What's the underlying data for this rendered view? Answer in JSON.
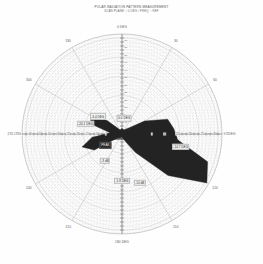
{
  "title": {
    "line1": "POLAR RADIATION PATTERN MEASUREMENT",
    "line2": "SCAN PLANE :: 0 DEG  /  FREQ :: REF"
  },
  "chart_data": {
    "type": "line",
    "subtype": "polar",
    "title": "POLAR RADIATION PATTERN MEASUREMENT",
    "subtitle": "SCAN PLANE :: 0 DEG  /  FREQ :: REF",
    "grid": true,
    "legend_position": "none",
    "angle_unit": "deg",
    "angle_direction": "counterclockwise",
    "angle_zero_at": "top",
    "rlim": [
      0,
      1
    ],
    "sector_count": 12,
    "ring_count": 26,
    "perimeter_labels": [
      {
        "angle": 0,
        "label": "0 DEG"
      },
      {
        "angle": 30,
        "label": "30"
      },
      {
        "angle": 60,
        "label": "60"
      },
      {
        "angle": 90,
        "label": "90 DEG"
      },
      {
        "angle": 120,
        "label": "120"
      },
      {
        "angle": 150,
        "label": "150"
      },
      {
        "angle": 180,
        "label": "180 DEG"
      },
      {
        "angle": 210,
        "label": "210"
      },
      {
        "angle": 240,
        "label": "240"
      },
      {
        "angle": 270,
        "label": "270 DEG"
      },
      {
        "angle": 300,
        "label": "300"
      },
      {
        "angle": 330,
        "label": "330"
      }
    ],
    "h_axis_ticks_left": [
      "-60",
      "-50",
      "-40",
      "-30",
      "-25",
      "-20",
      "-15",
      "-10",
      "-5"
    ],
    "h_axis_ticks_right": [
      "-5",
      "-10",
      "-15",
      "-20",
      "-25",
      "-30"
    ],
    "h_axis_end_left": "-70",
    "h_axis_end_right": "-70",
    "v_axis_ticks": [
      "-5",
      "-10",
      "-15",
      "-20",
      "-25",
      "-30",
      "-35",
      "-40",
      "-45",
      "-50",
      "-55",
      "-60"
    ],
    "series": [
      {
        "name": "pattern",
        "fill": "#232323",
        "points": [
          {
            "angle": 0,
            "r": 0.055
          },
          {
            "angle": 12,
            "r": 0.05
          },
          {
            "angle": 24,
            "r": 0.045
          },
          {
            "angle": 36,
            "r": 0.06
          },
          {
            "angle": 48,
            "r": 0.09
          },
          {
            "angle": 60,
            "r": 0.26
          },
          {
            "angle": 72,
            "r": 0.48
          },
          {
            "angle": 84,
            "r": 0.52
          },
          {
            "angle": 96,
            "r": 0.56
          },
          {
            "angle": 108,
            "r": 0.9
          },
          {
            "angle": 120,
            "r": 0.98
          },
          {
            "angle": 132,
            "r": 0.62
          },
          {
            "angle": 144,
            "r": 0.23
          },
          {
            "angle": 156,
            "r": 0.08
          },
          {
            "angle": 168,
            "r": 0.04
          },
          {
            "angle": 180,
            "r": 0.03
          },
          {
            "angle": 192,
            "r": 0.03
          },
          {
            "angle": 204,
            "r": 0.035
          },
          {
            "angle": 216,
            "r": 0.045
          },
          {
            "angle": 228,
            "r": 0.055
          },
          {
            "angle": 240,
            "r": 0.32
          },
          {
            "angle": 252,
            "r": 0.42
          },
          {
            "angle": 264,
            "r": 0.3
          },
          {
            "angle": 276,
            "r": 0.12
          },
          {
            "angle": 288,
            "r": 0.33
          },
          {
            "angle": 300,
            "r": 0.36
          },
          {
            "angle": 312,
            "r": 0.2
          },
          {
            "angle": 324,
            "r": 0.07
          },
          {
            "angle": 336,
            "r": 0.045
          },
          {
            "angle": 348,
            "r": 0.05
          }
        ]
      },
      {
        "name": "pattern-secondary",
        "fill": "#5e5e5e",
        "points": [
          {
            "angle": 96,
            "r": 0.12
          },
          {
            "angle": 108,
            "r": 0.3
          },
          {
            "angle": 120,
            "r": 0.56
          },
          {
            "angle": 132,
            "r": 0.38
          },
          {
            "angle": 144,
            "r": 0.15
          },
          {
            "angle": 156,
            "r": 0.06
          },
          {
            "angle": 252,
            "r": 0.18
          },
          {
            "angle": 264,
            "r": 0.15
          },
          {
            "angle": 276,
            "r": 0.06
          },
          {
            "angle": 288,
            "r": 0.11
          }
        ]
      }
    ],
    "annotations": [
      {
        "label": "-20.1 DEG",
        "angle": 286,
        "r": 0.38,
        "style": "light"
      },
      {
        "label": "-3.4 DEG",
        "angle": 306,
        "r": 0.3,
        "style": "light"
      },
      {
        "label": "-1.8 DEG",
        "angle": 180,
        "r": 0.47,
        "style": "light"
      },
      {
        "label": "0.0 DEG",
        "angle": 8,
        "r": 0.16,
        "style": "light"
      },
      {
        "label": "-14.7 DEG",
        "angle": 102,
        "r": 0.6,
        "style": "light"
      },
      {
        "label": "PEAK",
        "angle": 236,
        "r": 0.2,
        "style": "dark"
      },
      {
        "label": "-3 dB",
        "angle": 212,
        "r": 0.32,
        "style": "light"
      },
      {
        "label": "-10 dB",
        "angle": 160,
        "r": 0.52,
        "style": "light"
      }
    ]
  }
}
